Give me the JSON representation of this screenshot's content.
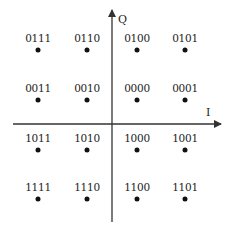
{
  "chart_data": {
    "type": "scatter",
    "title": "",
    "xlabel": "I",
    "ylabel": "Q",
    "grid": false,
    "legend": null,
    "points": [
      {
        "label": "0111",
        "x": -3,
        "y": 3
      },
      {
        "label": "0110",
        "x": -1,
        "y": 3
      },
      {
        "label": "0100",
        "x": 1,
        "y": 3
      },
      {
        "label": "0101",
        "x": 3,
        "y": 3
      },
      {
        "label": "0011",
        "x": -3,
        "y": 1
      },
      {
        "label": "0010",
        "x": -1,
        "y": 1
      },
      {
        "label": "0000",
        "x": 1,
        "y": 1
      },
      {
        "label": "0001",
        "x": 3,
        "y": 1
      },
      {
        "label": "1011",
        "x": -3,
        "y": -1
      },
      {
        "label": "1010",
        "x": -1,
        "y": -1
      },
      {
        "label": "1000",
        "x": 1,
        "y": -1
      },
      {
        "label": "1001",
        "x": 3,
        "y": -1
      },
      {
        "label": "1111",
        "x": -3,
        "y": -3
      },
      {
        "label": "1110",
        "x": -1,
        "y": -3
      },
      {
        "label": "1100",
        "x": 1,
        "y": -3
      },
      {
        "label": "1101",
        "x": 3,
        "y": -3
      }
    ]
  },
  "axes": {
    "x_label": "I",
    "y_label": "Q",
    "color": "#333333"
  },
  "layout": {
    "cols_px": [
      38,
      87,
      137,
      185
    ],
    "rows_px": [
      50,
      100,
      150,
      199
    ],
    "origin_px": [
      112,
      124
    ]
  },
  "colors": {
    "dot": "#111111",
    "text": "#222222",
    "background": "#ffffff"
  }
}
